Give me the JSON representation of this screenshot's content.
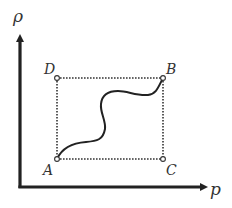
{
  "diagram": {
    "type": "process-path-on-axes",
    "axes": {
      "y_label": "ρ",
      "x_label": "p"
    },
    "points": {
      "A": {
        "label": "A",
        "position": "bottom-left"
      },
      "B": {
        "label": "B",
        "position": "top-right"
      },
      "C": {
        "label": "C",
        "position": "bottom-right"
      },
      "D": {
        "label": "D",
        "position": "top-left"
      }
    },
    "paths": [
      {
        "from": "A",
        "to": "B",
        "style": "solid-wavy-curve"
      },
      {
        "from": "A",
        "to": "D",
        "style": "dotted"
      },
      {
        "from": "D",
        "to": "B",
        "style": "dotted"
      },
      {
        "from": "A",
        "to": "C",
        "style": "dotted"
      },
      {
        "from": "C",
        "to": "B",
        "style": "dotted"
      }
    ],
    "colors": {
      "axis": "#222222",
      "curve": "#222222",
      "dotted": "#333333",
      "label": "#333333"
    }
  }
}
